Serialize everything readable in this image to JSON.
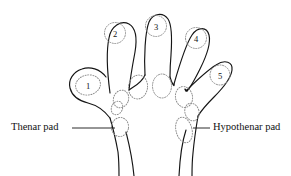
{
  "figure": {
    "background_color": "#ffffff",
    "outline_color": "#151515",
    "pad_color": "#8a8a8a",
    "width": 291,
    "height": 176
  },
  "labels": {
    "thenar": "Thenar pad",
    "hypothenar": "Hypothenar pad"
  },
  "digit_pads": [
    {
      "number": "1",
      "name": "digit-1-thumb",
      "cx": 88,
      "cy": 85,
      "rx": 12.5,
      "ry": 10.0,
      "rot": -12
    },
    {
      "number": "2",
      "name": "digit-2-index",
      "cx": 115,
      "cy": 33,
      "rx": 10.5,
      "ry": 10.5,
      "rot": 0
    },
    {
      "number": "3",
      "name": "digit-3-middle",
      "cx": 156,
      "cy": 26,
      "rx": 10.5,
      "ry": 10.5,
      "rot": 0
    },
    {
      "number": "4",
      "name": "digit-4-ring",
      "cx": 196,
      "cy": 38,
      "rx": 10.5,
      "ry": 10.5,
      "rot": 0
    },
    {
      "number": "5",
      "name": "digit-5-little",
      "cx": 220,
      "cy": 75,
      "rx": 10.0,
      "ry": 10.0,
      "rot": 0
    }
  ],
  "interdigital_pads": [
    {
      "name": "interdigital-pad-a",
      "cx": 138,
      "cy": 87,
      "rx": 9.5,
      "ry": 12.0,
      "rot": 8
    },
    {
      "name": "interdigital-pad-b",
      "cx": 162,
      "cy": 86,
      "rx": 9.5,
      "ry": 12.0,
      "rot": 0
    },
    {
      "name": "interdigital-pad-c",
      "cx": 184,
      "cy": 97,
      "rx": 8.5,
      "ry": 10.5,
      "rot": -12
    },
    {
      "name": "interdigital-pad-d",
      "cx": 121,
      "cy": 99,
      "rx": 7.5,
      "ry": 9.0,
      "rot": 22
    },
    {
      "name": "interdigital-pad-e",
      "cx": 192,
      "cy": 112,
      "rx": 7.0,
      "ry": 9.0,
      "rot": -18
    },
    {
      "name": "interdigital-pad-f",
      "cx": 117,
      "cy": 108,
      "rx": 5.5,
      "ry": 7.0,
      "rot": 25
    }
  ],
  "palmar_pads": [
    {
      "name": "thenar-pad-ellipse",
      "cx": 120,
      "cy": 127,
      "rx": 8.5,
      "ry": 9.5,
      "rot": 10
    },
    {
      "name": "hypothenar-pad-ellipse",
      "cx": 184,
      "cy": 130,
      "rx": 8.0,
      "ry": 13.0,
      "rot": -14
    }
  ],
  "leader_lines": [
    {
      "name": "thenar-leader-line",
      "x1": 72,
      "y1": 128,
      "x2": 115,
      "y2": 128
    },
    {
      "name": "hypothenar-leader-line",
      "x1": 193,
      "y1": 128,
      "x2": 210,
      "y2": 128
    }
  ]
}
